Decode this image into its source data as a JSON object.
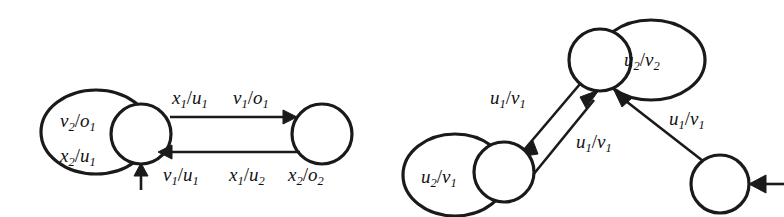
{
  "figure": {
    "background_color": "#ffffff",
    "ink_color": "#1a1a1a",
    "type": "finite-state-machine-diagrams",
    "count": 2
  },
  "diagram_left": {
    "name": "left-automaton",
    "nodes": [
      {
        "id": "L1",
        "cx": 141,
        "cy": 134,
        "r": 30
      },
      {
        "id": "L2",
        "cx": 322,
        "cy": 134,
        "r": 30
      }
    ],
    "self_loops": [
      {
        "id": "L1-loop",
        "on": "L1",
        "cx": 96,
        "cy": 132,
        "rx": 55,
        "ry": 42
      }
    ],
    "labels": {
      "loop_line1": {
        "base1": "v",
        "sub1": "2",
        "slash": "/",
        "base2": "o",
        "sub2": "1",
        "text": "v2/o1"
      },
      "loop_line2": {
        "base1": "x",
        "sub1": "2",
        "slash": "/",
        "base2": "u",
        "sub2": "1",
        "text": "x2/u1"
      },
      "top_1": {
        "base1": "x",
        "sub1": "1",
        "slash": "/",
        "base2": "u",
        "sub2": "1",
        "text": "x1/u1"
      },
      "top_2": {
        "base1": "v",
        "sub1": "1",
        "slash": "/",
        "base2": "o",
        "sub2": "1",
        "text": "v1/o1"
      },
      "bottom_1": {
        "base1": "v",
        "sub1": "1",
        "slash": "/",
        "base2": "u",
        "sub2": "1",
        "text": "v1/u1"
      },
      "bottom_2": {
        "base1": "x",
        "sub1": "1",
        "slash": "/",
        "base2": "u",
        "sub2": "2",
        "text": "x1/u2"
      },
      "bottom_3": {
        "base1": "x",
        "sub1": "2",
        "slash": "/",
        "base2": "o",
        "sub2": "2",
        "text": "x2/o2"
      }
    },
    "edges": [
      {
        "id": "L1-to-L2",
        "from": "L1",
        "to": "L2",
        "direction": "right",
        "labels": [
          "x1/u1",
          "v1/o1"
        ]
      },
      {
        "id": "L2-to-L1",
        "from": "L2",
        "to": "L1",
        "direction": "left",
        "labels": [
          "v1/u1",
          "x1/u2",
          "x2/o2"
        ]
      }
    ],
    "initial_arrow": {
      "id": "L1-initial",
      "target": "L1",
      "direction": "up"
    }
  },
  "diagram_right": {
    "name": "right-automaton",
    "nodes": [
      {
        "id": "R-top",
        "cx": 600,
        "cy": 60,
        "r": 31
      },
      {
        "id": "R-left",
        "cx": 504,
        "cy": 172,
        "r": 30
      },
      {
        "id": "R-right",
        "cx": 720,
        "cy": 184,
        "r": 29
      }
    ],
    "self_loops": [
      {
        "id": "R-top-loop",
        "on": "R-top",
        "cx": 651,
        "cy": 60,
        "rx": 54,
        "ry": 40
      },
      {
        "id": "R-left-loop",
        "on": "R-left",
        "cx": 455,
        "cy": 175,
        "rx": 52,
        "ry": 41
      }
    ],
    "labels": {
      "top_loop": {
        "base1": "u",
        "sub1": "2",
        "slash": "/",
        "base2": "v",
        "sub2": "2",
        "text": "u2/v2"
      },
      "left_loop": {
        "base1": "u",
        "sub1": "2",
        "slash": "/",
        "base2": "v",
        "sub2": "1",
        "text": "u2/v1"
      },
      "edge_upper_left": {
        "base1": "u",
        "sub1": "1",
        "slash": "/",
        "base2": "v",
        "sub2": "1",
        "text": "u1/v1"
      },
      "edge_middle": {
        "base1": "u",
        "sub1": "1",
        "slash": "/",
        "base2": "v",
        "sub2": "1",
        "text": "u1/v1"
      },
      "edge_right": {
        "base1": "u",
        "sub1": "1",
        "slash": "/",
        "base2": "v",
        "sub2": "1",
        "text": "u1/v1"
      }
    },
    "edges": [
      {
        "id": "R-top-to-left",
        "from": "R-top",
        "to": "R-left",
        "label": "u1/v1"
      },
      {
        "id": "R-left-to-top",
        "from": "R-left",
        "to": "R-top",
        "label": "u1/v1"
      },
      {
        "id": "R-right-to-top",
        "from": "R-right",
        "to": "R-top",
        "label": "u1/v1"
      }
    ],
    "initial_arrow": {
      "id": "R-right-initial",
      "target": "R-right",
      "direction": "left"
    }
  }
}
